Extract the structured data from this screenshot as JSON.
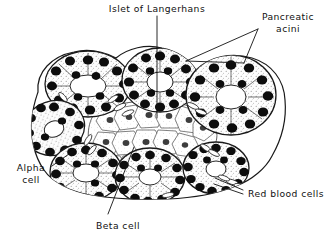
{
  "figure": {
    "style": "pen-and-ink line drawing",
    "background_color": "#ffffff",
    "ink_color": "#111111",
    "width": 326,
    "height": 242
  },
  "labels": [
    {
      "id": "islet-of-langerhans",
      "text": "Islet of Langerhans",
      "lines": [
        "Islet of Langerhans"
      ],
      "anchor": "middle",
      "x": 157,
      "y": 9,
      "leader": [
        [
          157,
          16
        ],
        [
          157,
          118
        ]
      ]
    },
    {
      "id": "pancreatic-acini",
      "text": "Pancreatic acini",
      "lines": [
        "Pancreatic",
        "acini"
      ],
      "anchor": "middle",
      "x": 288,
      "y": 17,
      "line_height": 12,
      "leader_a": [
        [
          258,
          29
        ],
        [
          186,
          61
        ]
      ],
      "leader_b": [
        [
          258,
          29
        ],
        [
          244,
          63
        ]
      ],
      "leader_c": [
        [
          186,
          61
        ],
        [
          244,
          63
        ]
      ]
    },
    {
      "id": "alpha-cell",
      "text": "Alpha cell",
      "lines": [
        "Alpha",
        "cell"
      ],
      "anchor": "middle",
      "x": 31,
      "y": 168,
      "line_height": 12,
      "leader": [
        [
          52,
          166
        ],
        [
          74,
          150
        ]
      ]
    },
    {
      "id": "beta-cell",
      "text": "Beta cell",
      "lines": [
        "Beta cell"
      ],
      "anchor": "middle",
      "x": 118,
      "y": 226,
      "leader": [
        [
          108,
          214
        ],
        [
          134,
          147
        ]
      ]
    },
    {
      "id": "red-blood-cells",
      "text": "Red blood cells",
      "lines": [
        "Red blood cells"
      ],
      "anchor": "start",
      "x": 248,
      "y": 194,
      "leader_a": [
        [
          243,
          190
        ],
        [
          215,
          178
        ]
      ],
      "leader_b": [
        [
          243,
          194
        ],
        [
          214,
          184
        ]
      ]
    }
  ],
  "structures": {
    "acini": [
      {
        "id": "acinus-top-left",
        "cx": 88,
        "cy": 84,
        "rx": 43,
        "ry": 33,
        "lumen_rx": 17,
        "lumen_ry": 11,
        "nuclei": 17,
        "rot": -4
      },
      {
        "id": "acinus-top-mid",
        "cx": 160,
        "cy": 80,
        "rx": 38,
        "ry": 32,
        "lumen_rx": 13,
        "lumen_ry": 10,
        "nuclei": 16,
        "rot": 3
      },
      {
        "id": "acinus-top-right",
        "cx": 231,
        "cy": 95,
        "rx": 45,
        "ry": 40,
        "lumen_rx": 15,
        "lumen_ry": 12,
        "nuclei": 18,
        "rot": 6
      },
      {
        "id": "acinus-left-mid",
        "cx": 54,
        "cy": 128,
        "rx": 31,
        "ry": 27,
        "lumen_rx": 10,
        "lumen_ry": 8,
        "nuclei": 13,
        "rot": -20
      },
      {
        "id": "acinus-bottom-left",
        "cx": 86,
        "cy": 172,
        "rx": 36,
        "ry": 29,
        "lumen_rx": 13,
        "lumen_ry": 9,
        "nuclei": 15,
        "rot": 2
      },
      {
        "id": "acinus-bottom-mid",
        "cx": 150,
        "cy": 176,
        "rx": 35,
        "ry": 28,
        "lumen_rx": 11,
        "lumen_ry": 8,
        "nuclei": 14,
        "rot": -3
      },
      {
        "id": "acinus-bottom-right",
        "cx": 216,
        "cy": 168,
        "rx": 33,
        "ry": 26,
        "lumen_rx": 10,
        "lumen_ry": 8,
        "nuclei": 13,
        "rot": 5
      }
    ],
    "islet": {
      "id": "islet-region",
      "cx": 152,
      "cy": 134,
      "rx": 60,
      "ry": 32,
      "cell_count": 24,
      "description": "pale polygonal endocrine cells with light stippled nuclei"
    },
    "red_blood_cells": {
      "id": "capillary-red-blood-cells",
      "count": 14,
      "description": "small elongated biconcave ellipses within capillaries"
    }
  }
}
